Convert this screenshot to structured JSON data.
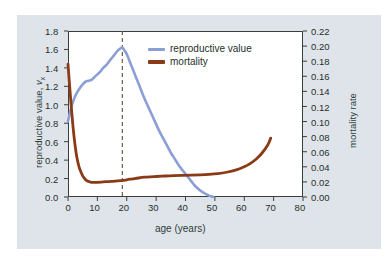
{
  "figure": {
    "background_outer": "#ffffff",
    "background_panel": "#dfe4ea",
    "plot_background": "#ffffff",
    "frame_color": "#3a3f3a"
  },
  "chart_data": {
    "type": "line",
    "title": "",
    "xlabel": "age (years)",
    "ylabel": "reproductive value, vx",
    "ylabel_right": "mortality rate",
    "xlim": [
      0,
      80
    ],
    "ylim": [
      0.0,
      1.8
    ],
    "ylim_right": [
      0.0,
      0.22
    ],
    "xticks": [
      0,
      10,
      20,
      30,
      40,
      50,
      60,
      70,
      80
    ],
    "xticklabels": [
      "0",
      "10",
      "20",
      "30",
      "40",
      "50",
      "60",
      "70",
      "80"
    ],
    "yticks": [
      0.0,
      0.2,
      0.4,
      0.6,
      0.8,
      1.0,
      1.2,
      1.4,
      1.6,
      1.8
    ],
    "yticklabels": [
      "0.0",
      "0.2",
      "0.4",
      "0.6",
      "0.8",
      "1.0",
      "1.2",
      "1.4",
      "1.6",
      "1.8"
    ],
    "yticks_right": [
      0.0,
      0.02,
      0.04,
      0.06,
      0.08,
      0.1,
      0.12,
      0.14,
      0.16,
      0.18,
      0.2,
      0.22
    ],
    "yticklabels_right": [
      "0.00",
      "0.02",
      "0.04",
      "0.06",
      "0.08",
      "0.10",
      "0.12",
      "0.14",
      "0.16",
      "0.18",
      "0.20",
      "0.22"
    ],
    "grid": false,
    "legend_position": "upper center",
    "annotations": [
      {
        "type": "vline",
        "name": "peak-reproductive-value-marker",
        "x": 18.5,
        "style": "dashed",
        "color": "#6e5a4a"
      }
    ],
    "series": [
      {
        "name": "reproductive value",
        "axis": "left",
        "color": "#8c9ed6",
        "linewidth": 2.6,
        "x": [
          0,
          1,
          2,
          3,
          4,
          5,
          6,
          7,
          8,
          9,
          10,
          11,
          12,
          13,
          14,
          15,
          16,
          17,
          18,
          18.5,
          19,
          20,
          21,
          22,
          23,
          24,
          25,
          26,
          27,
          28,
          29,
          30,
          31,
          32,
          33,
          34,
          35,
          36,
          37,
          38,
          39,
          40,
          41,
          42,
          43,
          44,
          45,
          46,
          47,
          48,
          49,
          49.5
        ],
        "y": [
          0.82,
          0.96,
          1.06,
          1.13,
          1.18,
          1.22,
          1.25,
          1.26,
          1.27,
          1.3,
          1.33,
          1.36,
          1.4,
          1.43,
          1.47,
          1.51,
          1.55,
          1.59,
          1.615,
          1.62,
          1.6,
          1.55,
          1.47,
          1.39,
          1.31,
          1.23,
          1.15,
          1.07,
          1.0,
          0.93,
          0.86,
          0.79,
          0.72,
          0.66,
          0.6,
          0.54,
          0.48,
          0.43,
          0.38,
          0.33,
          0.29,
          0.25,
          0.21,
          0.17,
          0.13,
          0.1,
          0.07,
          0.05,
          0.03,
          0.015,
          0.005,
          0.0
        ]
      },
      {
        "name": "mortality",
        "axis": "right",
        "color": "#8b3a18",
        "linewidth": 2.8,
        "x": [
          0,
          0.5,
          1,
          1.5,
          2,
          2.5,
          3,
          3.5,
          4,
          5,
          6,
          7,
          8,
          9,
          10,
          12,
          14,
          16,
          18,
          20,
          22,
          24,
          26,
          28,
          30,
          33,
          36,
          39,
          42,
          45,
          48,
          51,
          54,
          57,
          60,
          62,
          64,
          66,
          68,
          69
        ],
        "y": [
          0.176,
          0.15,
          0.125,
          0.102,
          0.082,
          0.066,
          0.053,
          0.044,
          0.037,
          0.028,
          0.023,
          0.0205,
          0.0195,
          0.0193,
          0.0195,
          0.02,
          0.0205,
          0.021,
          0.0218,
          0.0228,
          0.024,
          0.0252,
          0.0262,
          0.0268,
          0.0272,
          0.0278,
          0.0282,
          0.0286,
          0.029,
          0.0294,
          0.03,
          0.031,
          0.0328,
          0.0355,
          0.04,
          0.0443,
          0.05,
          0.058,
          0.069,
          0.078
        ]
      }
    ]
  },
  "legend": {
    "items": [
      {
        "label": "reproductive value",
        "color": "#8c9ed6"
      },
      {
        "label": "mortality",
        "color": "#8b3a18"
      }
    ]
  }
}
